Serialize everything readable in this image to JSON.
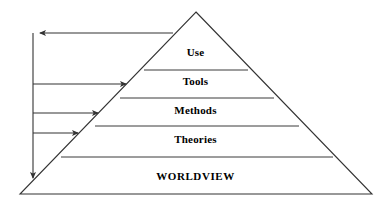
{
  "diagram": {
    "type": "pyramid-hierarchy",
    "stroke_color": "#333333",
    "background_color": "#ffffff",
    "text_color": "#000000",
    "levels": [
      {
        "id": "use",
        "label": "Use",
        "rank": 1,
        "position": "apex"
      },
      {
        "id": "tools",
        "label": "Tools",
        "rank": 2,
        "position": "upper-middle"
      },
      {
        "id": "methods",
        "label": "Methods",
        "rank": 3,
        "position": "middle"
      },
      {
        "id": "theories",
        "label": "Theories",
        "rank": 4,
        "position": "lower-middle"
      },
      {
        "id": "worldview",
        "label": "WORLDVIEW",
        "rank": 5,
        "position": "base"
      }
    ],
    "feedback_arrows": [
      {
        "id": "from-use",
        "direction": "left",
        "from_level": "use",
        "to": "spine"
      },
      {
        "id": "to-tools",
        "direction": "right",
        "from": "spine",
        "to_level": "tools"
      },
      {
        "id": "to-methods",
        "direction": "right",
        "from": "spine",
        "to_level": "methods"
      },
      {
        "id": "to-theories",
        "direction": "right",
        "from": "spine",
        "to_level": "theories"
      },
      {
        "id": "to-worldview",
        "direction": "down",
        "from": "spine",
        "to_level": "worldview"
      }
    ]
  }
}
